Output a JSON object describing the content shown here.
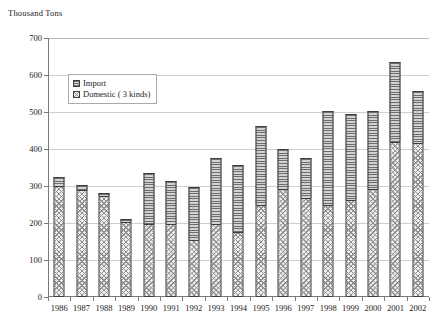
{
  "chart_data": {
    "type": "bar",
    "stacked": true,
    "title": "",
    "ylabel": "Thousand Tons",
    "xlabel": "",
    "ylim": [
      0,
      700
    ],
    "ytick_step": 100,
    "yticks": [
      0,
      100,
      200,
      300,
      400,
      500,
      600,
      700
    ],
    "grid": true,
    "legend_position": "upper-left-inside",
    "categories": [
      "1986",
      "1987",
      "1988",
      "1989",
      "1990",
      "1991",
      "1992",
      "1993",
      "1994",
      "1995",
      "1996",
      "1997",
      "1998",
      "1999",
      "2000",
      "2001",
      "2002"
    ],
    "series": [
      {
        "name": "Domestic ( 3 kinds)",
        "pattern": "cross-hatch",
        "values": [
          300,
          288,
          272,
          202,
          198,
          198,
          155,
          198,
          175,
          248,
          292,
          268,
          248,
          262,
          292,
          420,
          415
        ]
      },
      {
        "name": "Import",
        "pattern": "horizontal-lines",
        "values": [
          25,
          14,
          8,
          10,
          138,
          115,
          143,
          178,
          182,
          215,
          107,
          108,
          255,
          232,
          210,
          215,
          143
        ]
      }
    ],
    "totals": [
      325,
      302,
      280,
      212,
      336,
      313,
      298,
      376,
      357,
      463,
      399,
      376,
      503,
      494,
      502,
      635,
      558
    ]
  },
  "legend": {
    "items": [
      {
        "label": "Import",
        "swatch": "import"
      },
      {
        "label": "Domestic ( 3 kinds)",
        "swatch": "domestic"
      }
    ]
  },
  "axis": {
    "y_title": "Thousand Tons",
    "y_ticks": [
      "0",
      "100",
      "200",
      "300",
      "400",
      "500",
      "600",
      "700"
    ],
    "x_ticks": [
      "1986",
      "1987",
      "1988",
      "1989",
      "1990",
      "1991",
      "1992",
      "1993",
      "1994",
      "1995",
      "1996",
      "1997",
      "1998",
      "1999",
      "2000",
      "2001",
      "2002"
    ]
  },
  "colors": {
    "axis": "#7a7a7a",
    "grid": "#cfcfcf",
    "bar_outline": "#3f3f3f",
    "text": "#1a1a1a"
  }
}
